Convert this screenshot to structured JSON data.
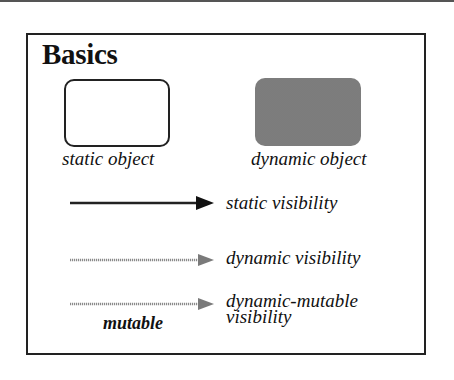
{
  "diagram": {
    "title": "Basics",
    "objects": [
      {
        "kind": "static",
        "label": "static object"
      },
      {
        "kind": "dynamic",
        "label": "dynamic object"
      }
    ],
    "edges": [
      {
        "kind": "static",
        "label": "static visibility"
      },
      {
        "kind": "dynamic",
        "label": "dynamic visibility"
      },
      {
        "kind": "dynamic-mutable",
        "label_line1": "dynamic-mutable",
        "label_line2": "visibility",
        "edge_label": "mutable"
      }
    ],
    "colors": {
      "stroke": "#222222",
      "dynamic_fill": "#bdbdbd",
      "dynamic_arrow": "#8a8a8a"
    }
  }
}
